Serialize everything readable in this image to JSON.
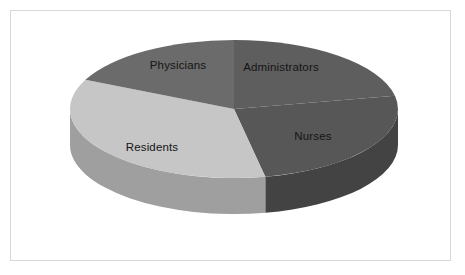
{
  "figure": {
    "width": 465,
    "height": 275,
    "background_color": "#ffffff",
    "border_color": "#d8d8d8",
    "label_text_color": "#151515"
  },
  "chart_data": {
    "type": "pie",
    "title": "",
    "subtitle": "",
    "xlabel": "",
    "ylabel": "",
    "grid": false,
    "legend": false,
    "legend_position": "none",
    "three_d": true,
    "labels_inside_slices": true,
    "start_angle_deg": 0,
    "direction": "clockwise",
    "categories": [
      "Administrators",
      "Nurses",
      "Residents",
      "Physicians"
    ],
    "values": [
      22,
      25,
      35,
      18
    ],
    "units": "percent",
    "slices": [
      {
        "label": "Administrators",
        "value": 22,
        "start_angle_deg": 0,
        "end_angle_deg": 79,
        "top_color": "#5e5e5e",
        "side_color": "#4a4a4a",
        "label_x": 281,
        "label_y": 67
      },
      {
        "label": "Nurses",
        "value": 25,
        "start_angle_deg": 79,
        "end_angle_deg": 169,
        "top_color": "#575757",
        "side_color": "#434343",
        "label_x": 313,
        "label_y": 136
      },
      {
        "label": "Residents",
        "value": 35,
        "start_angle_deg": 169,
        "end_angle_deg": 295,
        "top_color": "#c6c6c6",
        "side_color": "#9f9f9f",
        "label_x": 152,
        "label_y": 147
      },
      {
        "label": "Physicians",
        "value": 18,
        "start_angle_deg": 295,
        "end_angle_deg": 360,
        "top_color": "#6b6b6b",
        "side_color": "#565656",
        "label_x": 178,
        "label_y": 65
      }
    ],
    "geometry": {
      "center_x": 234,
      "center_y": 109,
      "radius_x": 164,
      "radius_y": 69,
      "depth": 36
    }
  }
}
